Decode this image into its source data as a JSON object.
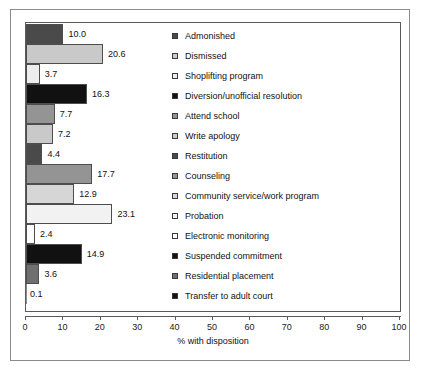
{
  "chart_data": {
    "type": "bar",
    "orientation": "horizontal",
    "title": "",
    "xlabel": "% with disposition",
    "ylabel": "",
    "xlim": [
      0,
      100
    ],
    "xticks": [
      "0",
      "10",
      "20",
      "30",
      "40",
      "50",
      "60",
      "70",
      "80",
      "90",
      "100"
    ],
    "xtick_values": [
      0,
      10,
      20,
      30,
      40,
      50,
      60,
      70,
      80,
      90,
      100
    ],
    "grid": false,
    "legend_position": "inside-right",
    "categories": [
      "Admonished",
      "Dismissed",
      "Shoplifting program",
      "Diversion/unofficial resolution",
      "Attend school",
      "Write apology",
      "Restitution",
      "Counseling",
      "Community service/work program",
      "Probation",
      "Electronic monitoring",
      "Suspended commitment",
      "Residential placement",
      "Transfer to adult court"
    ],
    "values": [
      10.0,
      20.6,
      3.7,
      16.3,
      7.7,
      7.2,
      4.4,
      17.7,
      12.9,
      23.1,
      2.4,
      14.9,
      3.6,
      0.1
    ],
    "value_labels": [
      "10.0",
      "20.6",
      "3.7",
      "16.3",
      "7.7",
      "7.2",
      "4.4",
      "17.7",
      "12.9",
      "23.1",
      "2.4",
      "14.9",
      "3.6",
      "0.1"
    ],
    "colors": [
      "#4a4a4a",
      "#c9c9c9",
      "#ededed",
      "#111111",
      "#949494",
      "#c9c9c9",
      "#4a4a4a",
      "#949494",
      "#d6d6d6",
      "#f2f2f2",
      "#fcfcfc",
      "#111111",
      "#6f6f6f",
      "#8d8d8d"
    ]
  },
  "legend": {
    "items": [
      {
        "label": "Admonished",
        "color": "#4a4a4a"
      },
      {
        "label": "Dismissed",
        "color": "#c9c9c9"
      },
      {
        "label": "Shoplifting program",
        "color": "#ededed"
      },
      {
        "label": "Diversion/unofficial resolution",
        "color": "#111111"
      },
      {
        "label": "Attend school",
        "color": "#949494"
      },
      {
        "label": "Write apology",
        "color": "#c9c9c9"
      },
      {
        "label": "Restitution",
        "color": "#4a4a4a"
      },
      {
        "label": "Counseling",
        "color": "#949494"
      },
      {
        "label": "Community service/work program",
        "color": "#d6d6d6"
      },
      {
        "label": "Probation",
        "color": "#f2f2f2"
      },
      {
        "label": "Electronic monitoring",
        "color": "#fcfcfc"
      },
      {
        "label": "Suspended commitment",
        "color": "#111111"
      },
      {
        "label": "Residential placement",
        "color": "#6f6f6f"
      },
      {
        "label": "Transfer to adult court",
        "color": "#111111"
      }
    ]
  }
}
